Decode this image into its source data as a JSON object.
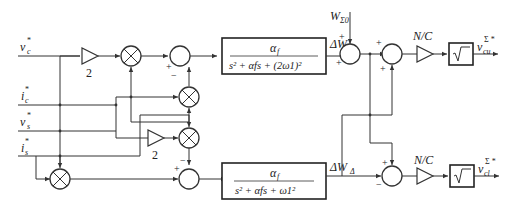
{
  "diagram": {
    "title": "",
    "inputs": {
      "vc": {
        "base": "v",
        "sub": "c",
        "sup": "*"
      },
      "ic": {
        "base": "i",
        "sub": "c",
        "sup": "*"
      },
      "vs": {
        "base": "v",
        "sub": "s",
        "sup": "*"
      },
      "is": {
        "base": "i",
        "sub": "s",
        "sup": "*"
      }
    },
    "gains": {
      "top_gain": "2",
      "mid_gain": "2",
      "nc_top": "N/C",
      "nc_bottom": "N/C"
    },
    "filters": {
      "sigma": {
        "numerator": "α",
        "numerator_sub": "f",
        "denominator": "s² + αfs + (2ω1)²",
        "den_parts": [
          "s",
          "2",
          "+ α",
          "f",
          "s + (2ω",
          "1",
          ")",
          "2"
        ]
      },
      "delta": {
        "numerator": "α",
        "numerator_sub": "f",
        "denominator": "s² + αfs + ω1²",
        "den_parts": [
          "s",
          "2",
          "+ α",
          "f",
          "s + ω",
          "1",
          "2"
        ]
      }
    },
    "signals": {
      "dW_sigma": {
        "base": "ΔW",
        "sub": "Σ"
      },
      "dW_delta": {
        "base": "ΔW",
        "sub": "Δ"
      },
      "W_sigma0": {
        "base": "W",
        "sub": "Σ0"
      },
      "v_cu": {
        "base": "v",
        "sub": "cu",
        "sup": "Σ *"
      },
      "v_cl": {
        "base": "v",
        "sub": "cl",
        "sup": "Σ *"
      }
    },
    "sqrt_symbol": "√",
    "signs": {
      "plus": "+",
      "minus": "−"
    },
    "colors": {
      "line": "#333333",
      "background": "#ffffff"
    }
  }
}
